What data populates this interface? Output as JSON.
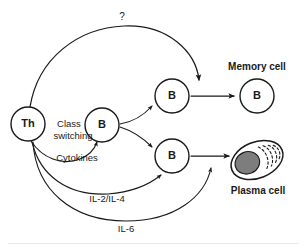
{
  "figure": {
    "background_color": "#ffffff",
    "line_color": "#1a1a1a",
    "nucleus_color": "#7d7d7d"
  },
  "cells": {
    "th": {
      "label": "Th",
      "x": 28,
      "y": 124,
      "r": 17
    },
    "b_activated": {
      "label": "B",
      "x": 102,
      "y": 125,
      "r": 17
    },
    "b_upper": {
      "label": "B",
      "x": 172,
      "y": 96,
      "r": 17
    },
    "b_lower": {
      "label": "B",
      "x": 172,
      "y": 156,
      "r": 17
    },
    "memory": {
      "label": "B",
      "x": 257,
      "y": 96,
      "r": 17
    },
    "plasma": {
      "x": 257,
      "y": 160
    }
  },
  "outer_labels": {
    "memory_cell": {
      "text": "Memory cell",
      "x": 257,
      "y": 67
    },
    "plasma_cell": {
      "text": "Plasma cell",
      "x": 258,
      "y": 191
    }
  },
  "annotations": {
    "question": {
      "text": "?",
      "x": 122,
      "y": 17
    },
    "class_switching_line1": {
      "text": "Class",
      "x": 69,
      "y": 124
    },
    "class_switching_line2": {
      "text": "switching",
      "x": 73,
      "y": 136
    },
    "cytokines": {
      "text": "Cytokines",
      "x": 77,
      "y": 158
    },
    "il2_il4": {
      "text": "IL-2/IL-4",
      "x": 107,
      "y": 199
    },
    "il6": {
      "text": "IL-6",
      "x": 126,
      "y": 229
    }
  },
  "connections": [
    {
      "name": "th-to-memory-question-arc",
      "from": "th",
      "to": "memory-region",
      "label": "?"
    },
    {
      "name": "th-to-b-class-switching",
      "from": "th",
      "to": "b_activated",
      "label": "Class switching"
    },
    {
      "name": "th-to-b-lower-il2-il4",
      "from": "th",
      "to": "b_lower",
      "label": "IL-2/IL-4"
    },
    {
      "name": "th-to-plasma-il6",
      "from": "th",
      "to": "plasma",
      "label": "IL-6"
    },
    {
      "name": "b-to-b-upper",
      "from": "b_activated",
      "to": "b_upper",
      "label": ""
    },
    {
      "name": "b-to-b-lower",
      "from": "b_activated",
      "to": "b_lower",
      "label": ""
    },
    {
      "name": "b-upper-to-memory",
      "from": "b_upper",
      "to": "memory",
      "label": ""
    },
    {
      "name": "b-lower-to-plasma",
      "from": "b_lower",
      "to": "plasma",
      "label": ""
    }
  ]
}
